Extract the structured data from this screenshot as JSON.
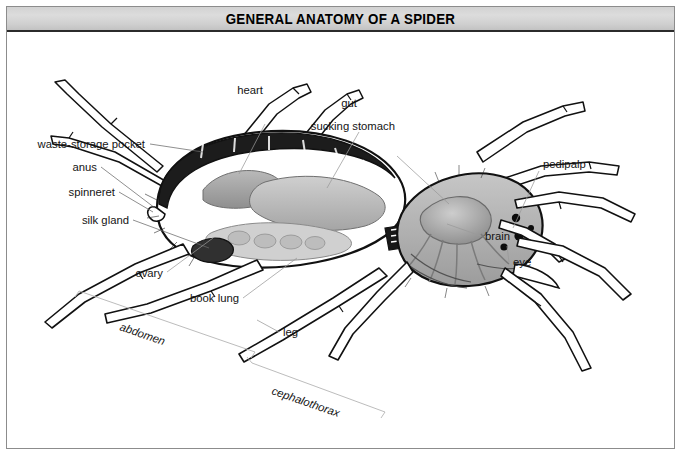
{
  "figure": {
    "title": "GENERAL ANATOMY OF A SPIDER",
    "border_color": "#8c8c8c",
    "title_band_color": "#d4d4d4",
    "ink_color": "#141414",
    "leader_color": "#9a9a9a"
  },
  "labels": {
    "waste_storage_pocket": "waste-storage pocket",
    "anus": "anus",
    "spinneret": "spinneret",
    "silk_gland": "silk gland",
    "heart": "heart",
    "gut": "gut",
    "sucking_stomach": "sucking stomach",
    "pedipalp": "pedipalp",
    "brain": "brain",
    "eye": "eye",
    "ovary": "ovary",
    "book_lung": "book lung",
    "leg": "leg",
    "abdomen": "abdomen",
    "cephalothorax": "cephalothorax"
  }
}
